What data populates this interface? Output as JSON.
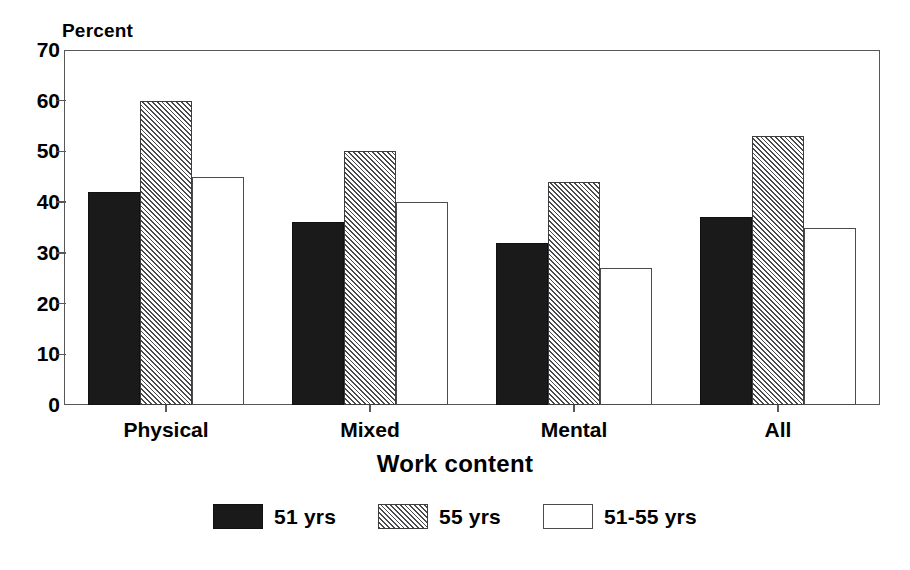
{
  "chart_data": {
    "type": "bar",
    "title": "",
    "ylabel": "Percent",
    "xlabel": "Work content",
    "categories": [
      "Physical",
      "Mixed",
      "Mental",
      "All"
    ],
    "series": [
      {
        "name": "51 yrs",
        "values": [
          42,
          36,
          32,
          37
        ],
        "style": "solid-black",
        "color": "#1a1a1a"
      },
      {
        "name": "55 yrs",
        "values": [
          60,
          50,
          44,
          53
        ],
        "style": "diagonal-hatch",
        "color": "#4a4a4c"
      },
      {
        "name": "51-55 yrs",
        "values": [
          45,
          40,
          27,
          35
        ],
        "style": "outline-white",
        "color": "#ffffff"
      }
    ],
    "ylim": [
      0,
      70
    ],
    "yticks": [
      0,
      10,
      20,
      30,
      40,
      50,
      60,
      70
    ],
    "ytick_labels": [
      "0",
      "10",
      "20",
      "30",
      "40",
      "50",
      "60",
      "70"
    ],
    "grid": false,
    "legend_position": "bottom-center",
    "frame_color": "#58585a"
  },
  "legend": {
    "entries": [
      {
        "label": "51 yrs"
      },
      {
        "label": "55 yrs"
      },
      {
        "label": "51-55 yrs"
      }
    ]
  }
}
